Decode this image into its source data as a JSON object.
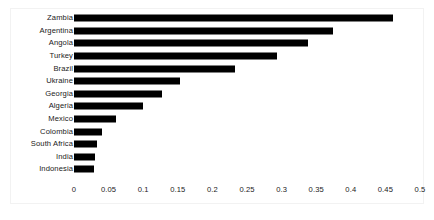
{
  "chart_data": {
    "type": "bar",
    "orientation": "horizontal",
    "title": "",
    "xlabel": "",
    "ylabel": "",
    "xlim": [
      0,
      0.5
    ],
    "grid": false,
    "legend": null,
    "bar_color": "#000000",
    "background_color": "#ffffff",
    "categories": [
      "Zambia",
      "Argentina",
      "Angola",
      "Turkey",
      "Brazil",
      "Ukraine",
      "Georgia",
      "Algeria",
      "Mexico",
      "Colombia",
      "South Africa",
      "India",
      "Indonesia"
    ],
    "values": [
      0.461,
      0.374,
      0.338,
      0.293,
      0.233,
      0.153,
      0.127,
      0.099,
      0.061,
      0.041,
      0.033,
      0.031,
      0.029
    ],
    "xticks": [
      0,
      0.05,
      0.1,
      0.15,
      0.2,
      0.25,
      0.3,
      0.35,
      0.4,
      0.45,
      0.5
    ],
    "xtick_labels": [
      "0",
      "0.05",
      "0.1",
      "0.15",
      "0.2",
      "0.25",
      "0.3",
      "0.35",
      "0.4",
      "0.45",
      "0.5"
    ]
  }
}
